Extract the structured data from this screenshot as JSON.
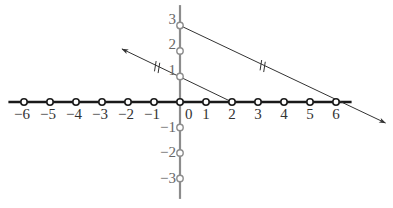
{
  "diagram": {
    "type": "coordinate-plane-parallel-lines",
    "origin_px": [
      180,
      102
    ],
    "unit_x_px": 26,
    "unit_y_px": 25.5,
    "colors": {
      "x_axis": "#1a1a1a",
      "y_axis": "#8c8c8c",
      "lines": "#333333",
      "labels": "#333333",
      "y_labels": "#666666",
      "point_fill": "#ffffff"
    },
    "x_axis": {
      "range": [
        -6.6,
        6.6
      ],
      "ticks": [
        {
          "value": -6,
          "label": "−6"
        },
        {
          "value": -5,
          "label": "−5"
        },
        {
          "value": -4,
          "label": "−4"
        },
        {
          "value": -3,
          "label": "−3"
        },
        {
          "value": -2,
          "label": "−2"
        },
        {
          "value": -1,
          "label": "−1"
        },
        {
          "value": 0,
          "label": "0"
        },
        {
          "value": 1,
          "label": "1"
        },
        {
          "value": 2,
          "label": "2"
        },
        {
          "value": 3,
          "label": "3"
        },
        {
          "value": 4,
          "label": "4"
        },
        {
          "value": 5,
          "label": "5"
        },
        {
          "value": 6,
          "label": "6"
        }
      ]
    },
    "y_axis": {
      "range": [
        -3.8,
        3.8
      ],
      "ticks": [
        {
          "value": 3,
          "label": "3"
        },
        {
          "value": 2,
          "label": "2"
        },
        {
          "value": 1,
          "label": "1"
        },
        {
          "value": -1,
          "label": "−1"
        },
        {
          "value": -2,
          "label": "−2"
        },
        {
          "value": -3,
          "label": "−3"
        }
      ]
    },
    "lines": [
      {
        "name": "line-through-0-3-and-6-0",
        "from": [
          0,
          3
        ],
        "to": [
          6,
          0
        ],
        "extend_to": [
          7.9,
          -0.82
        ],
        "arrow_end": true,
        "parallel_mark": [
          3.18,
          1.41
        ]
      },
      {
        "name": "line-through-0-1-and-2-0",
        "from": [
          2,
          0
        ],
        "to": [
          0,
          1
        ],
        "extend_to": [
          -2.23,
          2.08
        ],
        "arrow_end": true,
        "parallel_mark": [
          -0.88,
          1.37
        ]
      }
    ]
  }
}
